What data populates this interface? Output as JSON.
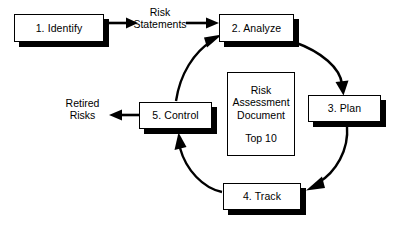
{
  "diagram": {
    "background_color": "#ffffff",
    "line_color": "#000000",
    "box_fill_color": "#ffffff",
    "steps": [
      {
        "id": "identify",
        "label": "1. Identify"
      },
      {
        "id": "analyze",
        "label": "2. Analyze"
      },
      {
        "id": "plan",
        "label": "3. Plan"
      },
      {
        "id": "track",
        "label": "4. Track"
      },
      {
        "id": "control",
        "label": "5. Control"
      }
    ],
    "center_document": {
      "line1": "Risk",
      "line2": "Assessment",
      "line3": "Document",
      "line4": "Top 10"
    },
    "flow_labels": {
      "risk_statements_line1": "Risk",
      "risk_statements_line2": "Statements",
      "retired_risks_line1": "Retired",
      "retired_risks_line2": "Risks"
    },
    "connectors": [
      {
        "id": "identify-to-analyze",
        "from": "1. Identify",
        "to": "2. Analyze",
        "label": "Risk Statements",
        "style": "straight"
      },
      {
        "id": "analyze-to-plan",
        "from": "2. Analyze",
        "to": "3. Plan",
        "label": "",
        "style": "curved"
      },
      {
        "id": "plan-to-track",
        "from": "3. Plan",
        "to": "4. Track",
        "label": "",
        "style": "curved"
      },
      {
        "id": "track-to-control",
        "from": "4. Track",
        "to": "5. Control",
        "label": "",
        "style": "curved"
      },
      {
        "id": "control-to-analyze",
        "from": "5. Control",
        "to": "2. Analyze",
        "label": "",
        "style": "curved"
      },
      {
        "id": "control-to-retired",
        "from": "5. Control",
        "to": "Retired Risks",
        "label": "Retired Risks",
        "style": "straight"
      }
    ]
  }
}
